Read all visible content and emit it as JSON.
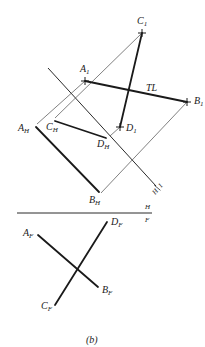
{
  "figure": {
    "caption": "(b)",
    "points": {
      "A1": {
        "label": "A",
        "sub": "1"
      },
      "B1": {
        "label": "B",
        "sub": "1"
      },
      "C1": {
        "label": "C",
        "sub": "1"
      },
      "D1": {
        "label": "D",
        "sub": "1"
      },
      "AH": {
        "label": "A",
        "sub": "H"
      },
      "BH": {
        "label": "B",
        "sub": "H"
      },
      "CH": {
        "label": "C",
        "sub": "H"
      },
      "DH": {
        "label": "D",
        "sub": "H"
      },
      "AF": {
        "label": "A",
        "sub": "F"
      },
      "BF": {
        "label": "B",
        "sub": "F"
      },
      "CF": {
        "label": "C",
        "sub": "F"
      },
      "DF": {
        "label": "D",
        "sub": "F"
      }
    },
    "annotations": {
      "true_length": "TL",
      "fold_h1_h": "H",
      "fold_h1_1": "1",
      "fold_hf_h": "H",
      "fold_hf_f": "F"
    }
  }
}
